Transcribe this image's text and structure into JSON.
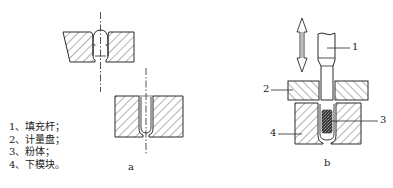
{
  "legend": {
    "items": [
      {
        "num": "1、",
        "text": "填充杆；"
      },
      {
        "num": "2、",
        "text": "计量盘；"
      },
      {
        "num": "3、",
        "text": "粉体；"
      },
      {
        "num": "4、",
        "text": "下模块。"
      }
    ]
  },
  "captions": {
    "a": "a",
    "b": "b"
  },
  "callouts": {
    "c1": "1",
    "c2": "2",
    "c3": "3",
    "c4": "4"
  },
  "colors": {
    "line": "#2a2a2a",
    "hatch": "#555555",
    "powder": "#3a3a3a",
    "background": "#ffffff"
  }
}
